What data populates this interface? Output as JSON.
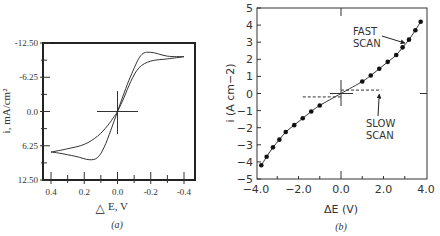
{
  "chart_data": [
    {
      "type": "line",
      "panel_label": "(a)",
      "title": "",
      "xlabel": "E, V",
      "xlabel_symbol": "△",
      "ylabel": "i, mA/cm²",
      "xlim": [
        0.45,
        -0.45
      ],
      "ylim": [
        -12.5,
        12.5
      ],
      "y_inverted": true,
      "xticks": [
        0.4,
        0.2,
        0.0,
        -0.2,
        -0.4
      ],
      "xtick_labels": [
        "0.4",
        "0.2",
        "0.0",
        "-0.2",
        "-0.4"
      ],
      "yticks": [
        -12.5,
        -6.25,
        0.0,
        6.25,
        12.5
      ],
      "ytick_labels": [
        "-12.50",
        "-6.25",
        "0.0",
        "6.25",
        "12.50"
      ],
      "grid": false,
      "series": [
        {
          "name": "cyclic voltammogram (forward)",
          "x": [
            0.4,
            0.3,
            0.2,
            0.12,
            0.06,
            0.02,
            0.0,
            -0.04,
            -0.08,
            -0.13,
            -0.2,
            -0.3,
            -0.4
          ],
          "y": [
            7.4,
            6.8,
            6.0,
            4.5,
            2.6,
            0.9,
            0.0,
            -2.6,
            -5.5,
            -8.0,
            -9.2,
            -9.6,
            -10.0
          ]
        },
        {
          "name": "cyclic voltammogram (reverse)",
          "x": [
            -0.4,
            -0.3,
            -0.2,
            -0.14,
            -0.08,
            -0.04,
            0.0,
            0.04,
            0.08,
            0.12,
            0.17,
            0.25,
            0.35,
            0.4
          ],
          "y": [
            -10.0,
            -10.1,
            -10.8,
            -10.2,
            -6.5,
            -3.4,
            0.0,
            3.4,
            6.5,
            8.4,
            8.8,
            8.2,
            7.6,
            7.4
          ]
        }
      ],
      "annotations": [
        "crosshair at origin (0,0)"
      ]
    },
    {
      "type": "scatter",
      "panel_label": "(b)",
      "title": "",
      "xlabel": "ΔE  (V)",
      "ylabel": "i  (A cm−2)",
      "xlim": [
        -4.0,
        4.0
      ],
      "ylim": [
        -5,
        5
      ],
      "xticks": [
        -4.0,
        -2.0,
        0.0,
        2.0,
        4.0
      ],
      "xtick_labels": [
        "−4.0",
        "−2.0",
        "0.0",
        "2.0",
        "4.0"
      ],
      "yticks": [
        5,
        4,
        3,
        2,
        1,
        0,
        -1,
        -2,
        -3,
        -4,
        -5
      ],
      "ytick_labels": [
        "5",
        "4",
        "3",
        "2",
        "1",
        "0",
        "−1",
        "−2",
        "−3",
        "−4",
        "−5"
      ],
      "grid": false,
      "series": [
        {
          "name": "FAST SCAN",
          "style": "line+markers",
          "x": [
            -3.75,
            -3.5,
            -3.2,
            -2.9,
            -2.6,
            -2.2,
            -1.8,
            -1.4,
            -1.0,
            1.0,
            1.4,
            1.8,
            2.2,
            2.6,
            2.9,
            3.2,
            3.5,
            3.75
          ],
          "y": [
            -4.2,
            -3.7,
            -3.15,
            -2.7,
            -2.25,
            -1.85,
            -1.45,
            -1.05,
            -0.7,
            0.7,
            1.05,
            1.45,
            1.85,
            2.25,
            2.7,
            3.15,
            3.7,
            4.2
          ]
        },
        {
          "name": "SLOW SCAN",
          "style": "dashed",
          "segments": [
            {
              "x": [
                -1.8,
                0.0
              ],
              "y": [
                -0.2,
                -0.2
              ]
            },
            {
              "x": [
                0.0,
                1.9
              ],
              "y": [
                0.2,
                0.2
              ]
            }
          ]
        }
      ],
      "annotations": [
        {
          "text": [
            "FAST",
            "SCAN"
          ],
          "arrow_to": [
            2.9,
            2.9
          ]
        },
        {
          "text": [
            "SLOW",
            "SCAN"
          ],
          "arrow_to": [
            1.8,
            0.15
          ]
        }
      ]
    }
  ]
}
